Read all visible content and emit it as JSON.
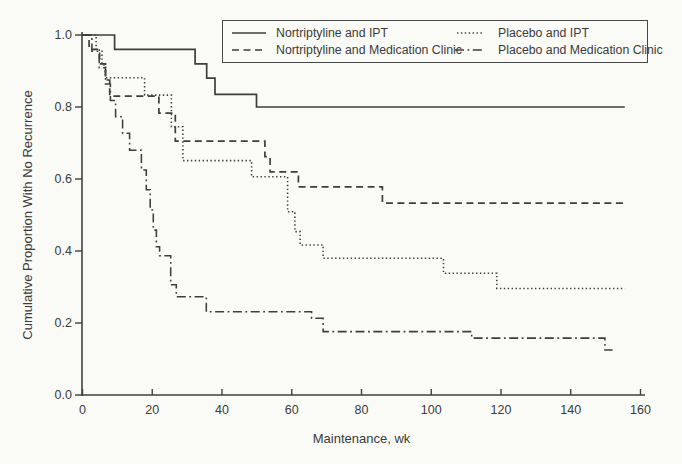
{
  "figure": {
    "background": "#fafaf7",
    "ink": "#3e3e3e"
  },
  "chart_data": {
    "type": "line",
    "subtype": "kaplan_meier_step",
    "title": "",
    "xlabel": "Maintenance, wk",
    "ylabel": "Cumulative Proportion With No Recurrence",
    "xlim": [
      0,
      160
    ],
    "ylim": [
      0.0,
      1.0
    ],
    "grid": false,
    "legend_position": "top center, inside plot, boxed, 2 columns",
    "x_ticks": [
      0,
      20,
      40,
      60,
      80,
      100,
      120,
      140,
      160
    ],
    "x_tick_labels": [
      "0",
      "20",
      "40",
      "60",
      "80",
      "100",
      "120",
      "140",
      "160"
    ],
    "y_ticks": [
      0.0,
      0.2,
      0.4,
      0.6,
      0.8,
      1.0
    ],
    "y_tick_labels": [
      "0.0",
      "0.2",
      "0.4",
      "0.6",
      "0.8",
      "1.0"
    ],
    "series": [
      {
        "name": "Nortriptyline and IPT",
        "style": "solid",
        "end_wk": 155.5,
        "steps": [
          [
            0,
            1.0
          ],
          [
            9.2,
            0.96
          ],
          [
            32.3,
            0.92
          ],
          [
            35.6,
            0.88
          ],
          [
            38,
            0.835
          ],
          [
            49.9,
            0.8
          ]
        ]
      },
      {
        "name": "Nortriptyline and Medication Clinic",
        "style": "dashed",
        "end_wk": 155.5,
        "steps": [
          [
            0,
            1.0
          ],
          [
            1.9,
            0.96
          ],
          [
            4.9,
            0.92
          ],
          [
            6.6,
            0.875
          ],
          [
            7.8,
            0.83
          ],
          [
            21.9,
            0.783
          ],
          [
            26.6,
            0.705
          ],
          [
            52.3,
            0.662
          ],
          [
            53.8,
            0.62
          ],
          [
            61.9,
            0.578
          ],
          [
            86,
            0.533
          ]
        ]
      },
      {
        "name": "Placebo and IPT",
        "style": "dotted",
        "end_wk": 155.5,
        "steps": [
          [
            0,
            1.0
          ],
          [
            3.9,
            0.958
          ],
          [
            5.6,
            0.917
          ],
          [
            6.6,
            0.881
          ],
          [
            17.8,
            0.833
          ],
          [
            25.5,
            0.745
          ],
          [
            28.8,
            0.651
          ],
          [
            48.5,
            0.606
          ],
          [
            58.8,
            0.509
          ],
          [
            60.9,
            0.454
          ],
          [
            62.4,
            0.417
          ],
          [
            69,
            0.38
          ],
          [
            103.5,
            0.338
          ],
          [
            118.8,
            0.296
          ]
        ]
      },
      {
        "name": "Placebo and Medication Clinic",
        "style": "dashdot",
        "end_wk": 152,
        "steps": [
          [
            0,
            1.0
          ],
          [
            2.7,
            0.955
          ],
          [
            4.8,
            0.909
          ],
          [
            6.6,
            0.864
          ],
          [
            8,
            0.818
          ],
          [
            9.5,
            0.773
          ],
          [
            11.5,
            0.727
          ],
          [
            13.5,
            0.68
          ],
          [
            16.9,
            0.625
          ],
          [
            18.3,
            0.57
          ],
          [
            19.4,
            0.514
          ],
          [
            20.3,
            0.458
          ],
          [
            21.2,
            0.412
          ],
          [
            22.1,
            0.387
          ],
          [
            25.3,
            0.306
          ],
          [
            26.9,
            0.273
          ],
          [
            35.5,
            0.231
          ],
          [
            65.7,
            0.213
          ],
          [
            69,
            0.176
          ],
          [
            111.6,
            0.158
          ],
          [
            149.8,
            0.125
          ]
        ]
      }
    ]
  }
}
